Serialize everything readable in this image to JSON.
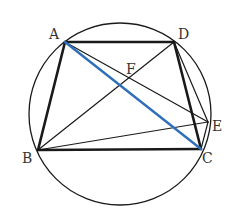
{
  "diagram": {
    "type": "geometry",
    "circle": {
      "cx": 120,
      "cy": 114,
      "r": 91
    },
    "colors": {
      "line": "#1a1a1a",
      "highlight": "#2f6fba",
      "label": "#333333"
    },
    "points": {
      "A": {
        "x": 65,
        "y": 42
      },
      "B": {
        "x": 38,
        "y": 150
      },
      "C": {
        "x": 201,
        "y": 149
      },
      "D": {
        "x": 174,
        "y": 42
      },
      "E": {
        "x": 208,
        "y": 122
      },
      "F": {
        "x": 124,
        "y": 79
      }
    },
    "labels": [
      {
        "text": "A",
        "x": 49,
        "y": 39
      },
      {
        "text": "D",
        "x": 178,
        "y": 39
      },
      {
        "text": "F",
        "x": 126,
        "y": 74
      },
      {
        "text": "E",
        "x": 212,
        "y": 131
      },
      {
        "text": "B",
        "x": 22,
        "y": 163
      },
      {
        "text": "C",
        "x": 202,
        "y": 163
      }
    ],
    "segments": [
      {
        "name": "AB",
        "from": "A",
        "to": "B",
        "style": "thick"
      },
      {
        "name": "AD",
        "from": "A",
        "to": "D",
        "style": "thick"
      },
      {
        "name": "DC",
        "from": "D",
        "to": "C",
        "style": "thick"
      },
      {
        "name": "BC",
        "from": "B",
        "to": "C",
        "style": "thick"
      },
      {
        "name": "AE",
        "from": "A",
        "to": "E",
        "style": "thin"
      },
      {
        "name": "BD",
        "from": "B",
        "to": "D",
        "style": "thin"
      },
      {
        "name": "BE",
        "from": "B",
        "to": "E",
        "style": "thin"
      },
      {
        "name": "DE",
        "from": "D",
        "to": "E",
        "style": "thin"
      },
      {
        "name": "CE",
        "from": "C",
        "to": "E",
        "style": "thin"
      },
      {
        "name": "AC",
        "from": "A",
        "to": "C",
        "style": "highlight"
      }
    ]
  }
}
